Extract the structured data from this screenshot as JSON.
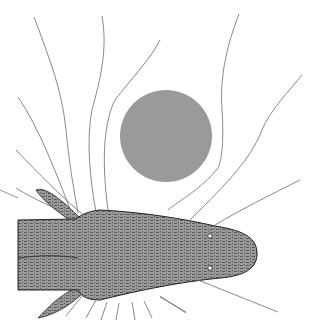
{
  "figure": {
    "object": {
      "shape": "circle",
      "color": "#9a9a9a",
      "cx": 166,
      "cy": 136,
      "r": 46
    },
    "fish": {
      "body_color": "#7a7a7a",
      "outline_color": "#222222",
      "eyes": 2,
      "fins": 2
    },
    "field_lines": {
      "color": "#6b6b6b",
      "count_above": 11,
      "count_below": 9
    }
  }
}
